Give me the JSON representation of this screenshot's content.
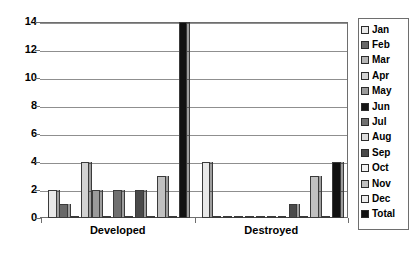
{
  "chart_data": {
    "type": "bar",
    "title": "",
    "subtitle": "",
    "xlabel": "",
    "ylabel": "",
    "categories": [
      "Developed",
      "Destroyed"
    ],
    "ylim": [
      0,
      14
    ],
    "ytick_labels": [
      "0",
      "2",
      "4",
      "6",
      "8",
      "10",
      "12",
      "14"
    ],
    "ytick_values": [
      0,
      2,
      4,
      6,
      8,
      10,
      12,
      14
    ],
    "grid": true,
    "legend_position": "right",
    "series": [
      {
        "name": "Jan",
        "color": "#e8e8e8",
        "values": [
          2,
          4
        ]
      },
      {
        "name": "Feb",
        "color": "#686868",
        "values": [
          1,
          0
        ]
      },
      {
        "name": "Mar",
        "color": "#b4b4b4",
        "values": [
          0,
          0
        ]
      },
      {
        "name": "Apr",
        "color": "#d2d2d2",
        "values": [
          4,
          0
        ]
      },
      {
        "name": "May",
        "color": "#9a9a9a",
        "values": [
          2,
          0
        ]
      },
      {
        "name": "Jun",
        "color": "#151515",
        "values": [
          0,
          0
        ]
      },
      {
        "name": "Jul",
        "color": "#707070",
        "values": [
          2,
          0
        ]
      },
      {
        "name": "Aug",
        "color": "#dcdcdc",
        "values": [
          0,
          0
        ]
      },
      {
        "name": "Sep",
        "color": "#4a4a4a",
        "values": [
          2,
          1
        ]
      },
      {
        "name": "Oct",
        "color": "#f2f2f2",
        "values": [
          0,
          0
        ]
      },
      {
        "name": "Nov",
        "color": "#c0c0c0",
        "values": [
          3,
          3
        ]
      },
      {
        "name": "Dec",
        "color": "#ededed",
        "values": [
          0,
          0
        ]
      },
      {
        "name": "Total",
        "color": "#111111",
        "values": [
          14,
          4
        ]
      }
    ]
  },
  "legend": {
    "items": [
      {
        "label": "Jan"
      },
      {
        "label": "Feb"
      },
      {
        "label": "Mar"
      },
      {
        "label": "Apr"
      },
      {
        "label": "May"
      },
      {
        "label": "Jun"
      },
      {
        "label": "Jul"
      },
      {
        "label": "Aug"
      },
      {
        "label": "Sep"
      },
      {
        "label": "Oct"
      },
      {
        "label": "Nov"
      },
      {
        "label": "Dec"
      },
      {
        "label": "Total"
      }
    ]
  }
}
